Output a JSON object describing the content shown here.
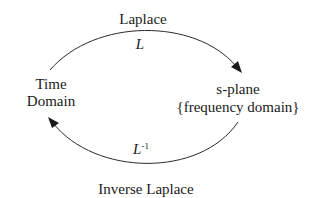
{
  "nodes": {
    "time_domain": {
      "line1": "Time",
      "line2": "Domain"
    },
    "s_plane": {
      "line1": "s-plane",
      "line2": "{frequency domain}"
    }
  },
  "edges": {
    "forward": {
      "label": "Laplace",
      "symbol": "L"
    },
    "inverse": {
      "label": "Inverse Laplace",
      "symbol": "L",
      "superscript": "-1"
    }
  },
  "colors": {
    "stroke": "#2a2a2a",
    "text": "#1a1a1a",
    "background": "#ffffff"
  }
}
